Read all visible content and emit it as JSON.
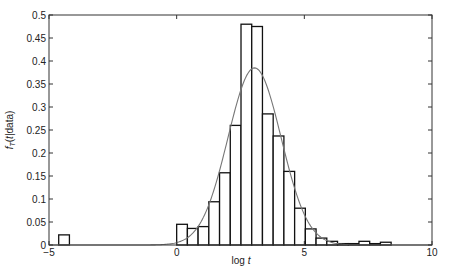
{
  "chart_data": {
    "type": "bar",
    "subtype": "histogram-with-density-fit",
    "title": "",
    "xlabel": "log t",
    "ylabel": "f_T(t|data)",
    "xlim": [
      -5,
      10
    ],
    "ylim": [
      0,
      0.5
    ],
    "xticks": [
      -5,
      0,
      5,
      10
    ],
    "yticks": [
      0,
      0.05,
      0.1,
      0.15,
      0.2,
      0.25,
      0.3,
      0.35,
      0.4,
      0.45,
      0.5
    ],
    "ytick_labels": [
      "0",
      "0.05",
      "0.1",
      "0.15",
      "0.2",
      "0.25",
      "0.3",
      "0.35",
      "0.4",
      "0.45",
      "0.5"
    ],
    "xtick_labels": [
      "−5",
      "0",
      "5",
      "10"
    ],
    "grid": false,
    "bin_width": 0.42,
    "bins": [
      {
        "left": -4.62,
        "right": -4.2,
        "value": 0.022
      },
      {
        "left": 0.0,
        "right": 0.42,
        "value": 0.045
      },
      {
        "left": 0.42,
        "right": 0.84,
        "value": 0.036
      },
      {
        "left": 0.84,
        "right": 1.26,
        "value": 0.04
      },
      {
        "left": 1.26,
        "right": 1.68,
        "value": 0.094
      },
      {
        "left": 1.68,
        "right": 2.1,
        "value": 0.157
      },
      {
        "left": 2.1,
        "right": 2.52,
        "value": 0.26
      },
      {
        "left": 2.52,
        "right": 2.94,
        "value": 0.48
      },
      {
        "left": 2.94,
        "right": 3.36,
        "value": 0.475
      },
      {
        "left": 3.36,
        "right": 3.78,
        "value": 0.285
      },
      {
        "left": 3.78,
        "right": 4.2,
        "value": 0.237
      },
      {
        "left": 4.2,
        "right": 4.62,
        "value": 0.16
      },
      {
        "left": 4.62,
        "right": 5.04,
        "value": 0.08
      },
      {
        "left": 5.04,
        "right": 5.46,
        "value": 0.035
      },
      {
        "left": 5.46,
        "right": 5.88,
        "value": 0.015
      },
      {
        "left": 5.88,
        "right": 6.3,
        "value": 0.008
      },
      {
        "left": 6.3,
        "right": 6.72,
        "value": 0.003
      },
      {
        "left": 6.72,
        "right": 7.14,
        "value": 0.003
      },
      {
        "left": 7.14,
        "right": 7.56,
        "value": 0.008
      },
      {
        "left": 7.56,
        "right": 7.98,
        "value": 0.003
      },
      {
        "left": 7.98,
        "right": 8.4,
        "value": 0.006
      }
    ],
    "fit_curve": {
      "type": "normal-density",
      "mean": 3.05,
      "std": 1.04,
      "peak": 0.385,
      "color": "#777777"
    },
    "colors": {
      "bar_edge": "#111111",
      "bar_fill": "#ffffff",
      "axis": "#333333",
      "curve": "#777777"
    }
  }
}
